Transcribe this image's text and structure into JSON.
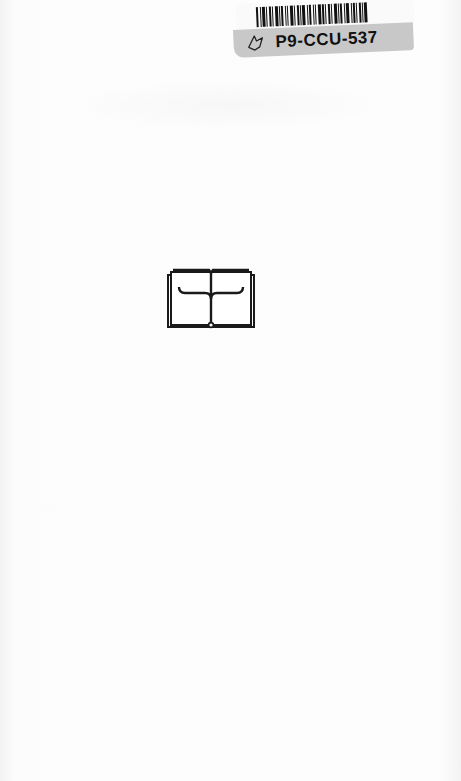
{
  "page": {
    "type": "scanned book page",
    "background_color": "#fcfcfc"
  },
  "sticker": {
    "code": "P9-CCU-537",
    "icon": "bird-outline-icon",
    "band_color": "#c8c8c8",
    "barcode_icon": "barcode-icon"
  },
  "logo": {
    "icon": "open-book-icon",
    "color": "#1a1a1a"
  }
}
